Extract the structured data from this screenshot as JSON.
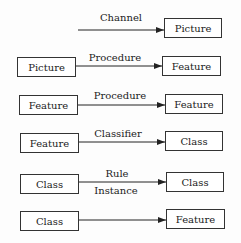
{
  "diagram": {
    "rows": [
      {
        "from": "",
        "to": "Picture",
        "label_above": "Channel",
        "label_below": ""
      },
      {
        "from": "Picture",
        "to": "Feature",
        "label_above": "Procedure",
        "label_below": ""
      },
      {
        "from": "Feature",
        "to": "Feature",
        "label_above": "Procedure",
        "label_below": ""
      },
      {
        "from": "Feature",
        "to": "Class",
        "label_above": "Classifier",
        "label_below": ""
      },
      {
        "from": "Class",
        "to": "Class",
        "label_above": "Rule",
        "label_below": "Instance"
      },
      {
        "from": "Class",
        "to": "Feature",
        "label_above": "",
        "label_below": ""
      }
    ]
  }
}
